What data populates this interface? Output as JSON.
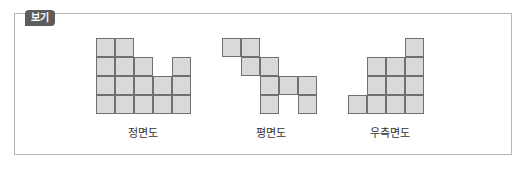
{
  "badge": {
    "label": "보기"
  },
  "views": [
    {
      "label": "정면도",
      "name": "front-view"
    },
    {
      "label": "평면도",
      "name": "top-view"
    },
    {
      "label": "우측면도",
      "name": "right-side-view"
    }
  ],
  "colors": {
    "cell_fill": "#d9d9d9",
    "cell_border": "#707070",
    "badge_bg": "#5d5d5d",
    "frame_border": "#b5b5b5"
  }
}
